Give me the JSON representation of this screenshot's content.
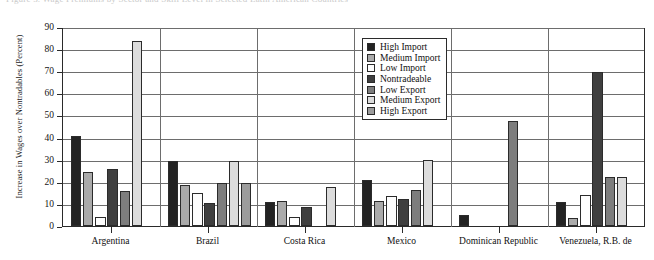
{
  "top_caption": "Figure 3. Wage Premiums by Sector and Skill Level in Selected Latin American Countries",
  "chart_data": {
    "type": "bar",
    "title": "",
    "xlabel": "",
    "ylabel": "Increase in Wages over Nontradables (Percent)",
    "ylim": [
      0,
      90
    ],
    "ytick_step": 10,
    "yticks": [
      "0",
      "10",
      "20",
      "30",
      "40",
      "50",
      "60",
      "70",
      "80",
      "90"
    ],
    "grid": true,
    "legend_position": "inside-top-center",
    "categories": [
      "Argentina",
      "Brazil",
      "Costa Rica",
      "Mexico",
      "Dominican Republic",
      "Venezuela, R.B. de"
    ],
    "series": [
      {
        "name": "High Import",
        "color": "#232323",
        "values": [
          40.5,
          29.5,
          11.0,
          21.0,
          5.0,
          11.0
        ]
      },
      {
        "name": "Medium Import",
        "color": "#aaaaaa",
        "values": [
          24.5,
          18.5,
          11.5,
          11.5,
          0.0,
          3.5
        ]
      },
      {
        "name": "Low Import",
        "color": "#fdfdfd",
        "values": [
          4.0,
          15.0,
          4.0,
          13.5,
          0.0,
          14.0
        ]
      },
      {
        "name": "Nontradeable",
        "color": "#3f3f3f",
        "values": [
          26.0,
          10.5,
          8.5,
          12.0,
          0.0,
          69.5
        ]
      },
      {
        "name": "Low Export",
        "color": "#7d7d7d",
        "values": [
          16.0,
          19.5,
          0.0,
          16.5,
          47.5,
          22.0
        ]
      },
      {
        "name": "Medium Export",
        "color": "#dcdcdc",
        "values": [
          83.5,
          29.5,
          17.5,
          30.0,
          0.0,
          22.0
        ]
      },
      {
        "name": "High Export",
        "color": "#9c9c9c",
        "values": [
          0.0,
          19.5,
          0.0,
          0.0,
          0.0,
          0.0
        ]
      }
    ]
  }
}
